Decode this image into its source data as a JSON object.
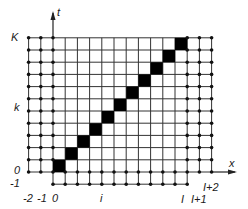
{
  "diagram": {
    "axes": {
      "x_label": "x",
      "t_label": "t"
    },
    "grid": {
      "columns": [
        "-2",
        "-1",
        "0",
        "1",
        "2",
        "3",
        "4",
        "5",
        "6",
        "7",
        "8",
        "9",
        "10",
        "I",
        "I+1",
        "I+2"
      ],
      "rows_count_interior": 11,
      "I_value_index": 11,
      "K_value_index": 11,
      "spacing_px": 12.2
    },
    "labels": {
      "row_K": "K",
      "row_k": "k",
      "row_0": "0",
      "row_minus1": "-1",
      "col_minus2": "-2",
      "col_minus1": "-1",
      "col_0": "0",
      "col_i": "i",
      "col_I": "I",
      "col_I_plus_1": "I+1",
      "col_I_plus_2": "I+2"
    },
    "highlighted_cells": "diagonal cells (n, n) for n = 0..10 filled black",
    "colors": {
      "line": "#333333",
      "dot": "#111111",
      "cell": "#000000",
      "background": "#ffffff"
    }
  }
}
